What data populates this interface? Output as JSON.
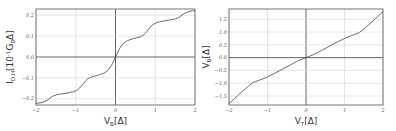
{
  "chart_data": [
    {
      "type": "line",
      "title": "",
      "xlabel": "V_B[Δ]",
      "xlabel_main": "V",
      "xlabel_sub": "B",
      "xlabel_unit": "[Δ]",
      "ylabel": "I_D,H[10^-1 G_0 Δ]",
      "ylabel_main": "I",
      "ylabel_sub": "D,H",
      "ylabel_unit_pre": "[10",
      "ylabel_sup": "-1",
      "ylabel_unit_mid": "G",
      "ylabel_sub2": "0",
      "ylabel_unit_post": "Δ]",
      "xlim": [
        -2,
        2
      ],
      "ylim": [
        -0.23,
        0.23
      ],
      "xticks": [
        -2,
        -1,
        0,
        1,
        2
      ],
      "xtick_labels": [
        "−2",
        "−1",
        "0",
        "1",
        "2"
      ],
      "yticks": [
        -0.2,
        -0.1,
        0.0,
        0.1,
        0.2
      ],
      "ytick_labels": [
        "−0.2",
        "−0.1",
        "0.0",
        "0.1",
        "0.2"
      ],
      "grid": true,
      "legend": null,
      "series": [
        {
          "name": "I_D,H",
          "x": [
            -2.0,
            -1.85,
            -1.7,
            -1.6,
            -1.5,
            -1.4,
            -1.25,
            -1.1,
            -1.0,
            -0.9,
            -0.8,
            -0.7,
            -0.6,
            -0.45,
            -0.3,
            -0.2,
            -0.1,
            -0.05,
            0.0,
            0.05,
            0.1,
            0.2,
            0.3,
            0.45,
            0.6,
            0.7,
            0.8,
            0.9,
            1.0,
            1.1,
            1.25,
            1.4,
            1.5,
            1.6,
            1.7,
            1.85,
            2.0
          ],
          "values": [
            -0.222,
            -0.218,
            -0.205,
            -0.19,
            -0.182,
            -0.178,
            -0.174,
            -0.168,
            -0.162,
            -0.148,
            -0.125,
            -0.105,
            -0.095,
            -0.088,
            -0.078,
            -0.065,
            -0.04,
            -0.02,
            0.0,
            0.02,
            0.04,
            0.065,
            0.078,
            0.088,
            0.095,
            0.105,
            0.125,
            0.148,
            0.162,
            0.168,
            0.174,
            0.178,
            0.182,
            0.19,
            0.205,
            0.218,
            0.222
          ]
        }
      ]
    },
    {
      "type": "line",
      "title": "",
      "xlabel": "V_T[Δ]",
      "xlabel_main": "V",
      "xlabel_sub": "T",
      "xlabel_unit": "[Δ]",
      "ylabel": "V_B[Δ]",
      "ylabel_main": "V",
      "ylabel_sub": "B",
      "ylabel_unit": "[Δ]",
      "xlim": [
        -2,
        2
      ],
      "ylim": [
        -1.85,
        1.9
      ],
      "xticks": [
        -2,
        -1,
        0,
        1,
        2
      ],
      "xtick_labels": [
        "−2",
        "−1",
        "0",
        "1",
        "2"
      ],
      "yticks": [
        -1.5,
        -1.0,
        -0.5,
        0.0,
        0.5,
        1.0,
        1.5
      ],
      "ytick_labels": [
        "−1.5",
        "−1.0",
        "−0.5",
        "0.0",
        "0.5",
        "1.0",
        "1.5"
      ],
      "grid": true,
      "legend": null,
      "series": [
        {
          "name": "V_B",
          "x": [
            -2.0,
            -1.7,
            -1.4,
            -1.3,
            -1.0,
            -0.7,
            -0.4,
            -0.2,
            0.0,
            0.2,
            0.4,
            0.7,
            1.0,
            1.3,
            1.4,
            1.7,
            2.0
          ],
          "values": [
            -1.8,
            -1.38,
            -1.0,
            -0.93,
            -0.75,
            -0.52,
            -0.28,
            -0.12,
            0.0,
            0.12,
            0.28,
            0.52,
            0.75,
            0.93,
            1.0,
            1.38,
            1.8
          ]
        }
      ]
    }
  ]
}
